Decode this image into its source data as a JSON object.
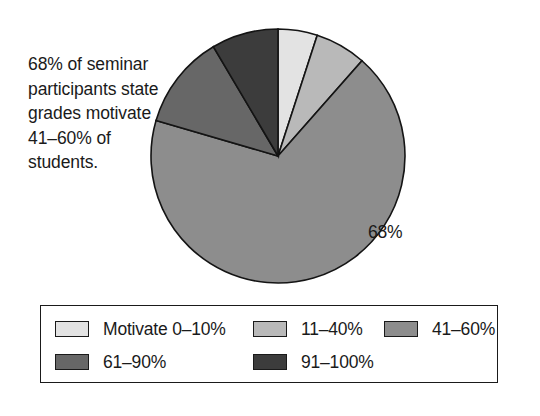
{
  "caption": {
    "text": "68% of seminar participants state grades motivate 41–60% of students."
  },
  "pie": {
    "value_label": "68%"
  },
  "legend": {
    "rows": [
      [
        {
          "label": "Motivate 0–10%",
          "color": "#e3e3e3"
        },
        {
          "label": "11–40%",
          "color": "#b9b9b9"
        },
        {
          "label": "41–60%",
          "color": "#8d8d8d"
        }
      ],
      [
        {
          "label": "61–90%",
          "color": "#676767"
        },
        {
          "label": "91–100%",
          "color": "#3c3c3c"
        }
      ]
    ]
  },
  "chart_data": {
    "type": "pie",
    "title": "",
    "subtitle": "",
    "xlabel": "",
    "ylabel": "",
    "legend_position": "bottom",
    "grid": false,
    "start_angle_deg": 0,
    "direction": "clockwise",
    "categories": [
      "Motivate 0–10%",
      "11–40%",
      "41–60%",
      "61–90%",
      "91–100%"
    ],
    "values": [
      5,
      6.5,
      68,
      12,
      8.5
    ],
    "unit": "%",
    "colors": [
      "#e3e3e3",
      "#b9b9b9",
      "#8d8d8d",
      "#676767",
      "#3c3c3c"
    ],
    "data_labels": [
      "",
      "",
      "68%",
      "",
      ""
    ],
    "annotations": [
      "68% of seminar participants state grades motivate 41–60% of students."
    ]
  }
}
